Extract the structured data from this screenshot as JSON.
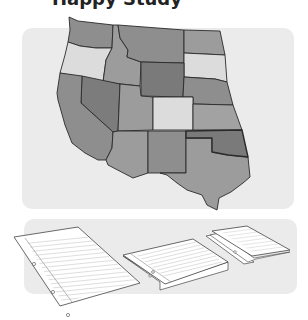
{
  "heading": {
    "text": "Happy Study",
    "note": "heading text is cropped at top edge; only descenders visible"
  },
  "map": {
    "label": "Western United States map",
    "colors": {
      "panel_bg": "#ebebeb",
      "dark": "#7c7c7c",
      "medium": "#909090",
      "mid_light": "#9c9c9c",
      "light": "#dcdcdc",
      "border": "#2a2a2a"
    },
    "states": [
      {
        "id": "WA",
        "name": "Washington",
        "shade": "medium"
      },
      {
        "id": "OR",
        "name": "Oregon",
        "shade": "light"
      },
      {
        "id": "ID",
        "name": "Idaho",
        "shade": "mid_light"
      },
      {
        "id": "MT",
        "name": "Montana",
        "shade": "medium"
      },
      {
        "id": "ND",
        "name": "North Dakota",
        "shade": "mid_light"
      },
      {
        "id": "SD",
        "name": "South Dakota",
        "shade": "light"
      },
      {
        "id": "WY",
        "name": "Wyoming",
        "shade": "dark"
      },
      {
        "id": "NE",
        "name": "Nebraska",
        "shade": "medium"
      },
      {
        "id": "NV",
        "name": "Nevada",
        "shade": "dark"
      },
      {
        "id": "UT",
        "name": "Utah",
        "shade": "mid_light"
      },
      {
        "id": "CO",
        "name": "Colorado",
        "shade": "light"
      },
      {
        "id": "KS",
        "name": "Kansas",
        "shade": "mid_light"
      },
      {
        "id": "CA",
        "name": "California",
        "shade": "medium"
      },
      {
        "id": "AZ",
        "name": "Arizona",
        "shade": "mid_light"
      },
      {
        "id": "NM",
        "name": "New Mexico",
        "shade": "medium"
      },
      {
        "id": "OK",
        "name": "Oklahoma",
        "shade": "dark"
      },
      {
        "id": "TX",
        "name": "Texas",
        "shade": "mid_light"
      }
    ]
  },
  "notebooks": {
    "label": "Lined notebook paper illustrations",
    "items": [
      {
        "id": "open-sheet",
        "description": "single loose-leaf sheet with three holes"
      },
      {
        "id": "folded-sheet",
        "description": "sheet folded in half, lying flat"
      },
      {
        "id": "folded-twice",
        "description": "sheet folded into quarters"
      }
    ]
  }
}
